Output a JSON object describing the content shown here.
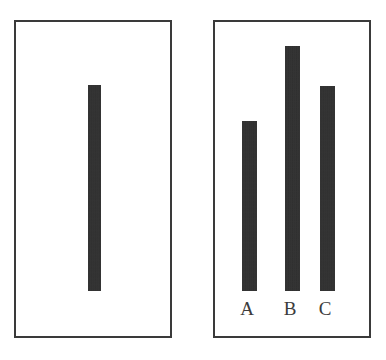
{
  "figure": {
    "background_color": "#ffffff",
    "ink_color": "#2b2b2b",
    "border_color": "#3a3a3a",
    "panel_count": 2
  },
  "chart_data": [
    {
      "type": "bar",
      "panel": "left",
      "title": "",
      "xlabel": "",
      "ylabel": "",
      "categories": [
        ""
      ],
      "tick_labels": [],
      "values": [
        206
      ],
      "ylim": [
        0,
        271
      ],
      "grid": false,
      "legend": null,
      "notes": "Single unlabeled reference bar, vertically centered-left within a plain rectangular frame."
    },
    {
      "type": "bar",
      "panel": "right",
      "title": "",
      "xlabel": "",
      "ylabel": "",
      "categories": [
        "A",
        "B",
        "C"
      ],
      "tick_labels": [
        "A",
        "B",
        "C"
      ],
      "values": [
        170,
        245,
        205
      ],
      "ylim": [
        0,
        271
      ],
      "grid": false,
      "legend": null,
      "notes": "Three labeled bars sharing a common baseline inside a plain rectangular frame."
    }
  ],
  "panels": {
    "left": {
      "name": "reference-panel",
      "bars": [
        {
          "id": "reference",
          "label": "",
          "value": 206,
          "height_px": 206,
          "width_px": 13,
          "left_px": 72,
          "bottom_px": 45
        }
      ]
    },
    "right": {
      "name": "comparison-panel",
      "bars": [
        {
          "id": "A",
          "label": "A",
          "value": 170,
          "height_px": 170,
          "width_px": 15,
          "left_px": 27,
          "bottom_px": 45
        },
        {
          "id": "B",
          "label": "B",
          "value": 245,
          "height_px": 245,
          "width_px": 15,
          "left_px": 70,
          "bottom_px": 45
        },
        {
          "id": "C",
          "label": "C",
          "value": 205,
          "height_px": 205,
          "width_px": 15,
          "left_px": 105,
          "bottom_px": 45
        }
      ],
      "labels": [
        {
          "text": "A",
          "left_px": 234
        },
        {
          "text": "B",
          "left_px": 277
        },
        {
          "text": "C",
          "left_px": 312
        }
      ]
    }
  }
}
